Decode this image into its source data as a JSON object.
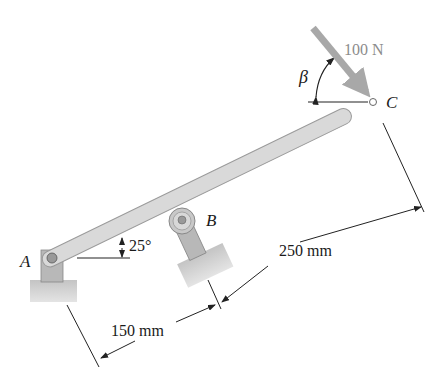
{
  "figure": {
    "labels": {
      "point_a": "A",
      "point_b": "B",
      "point_c": "C",
      "force": "100 N",
      "angle_beta": "β",
      "angle_bar": "25°",
      "dim_ab": "150 mm",
      "dim_bc": "250 mm"
    },
    "colors": {
      "bar": "#d9d9d9",
      "bar_edge": "#9a9a9a",
      "force_arrow": "#a8a8a8",
      "force_text": "#8c8c8c",
      "ground": "#cfcfcf",
      "line": "#222222"
    }
  }
}
